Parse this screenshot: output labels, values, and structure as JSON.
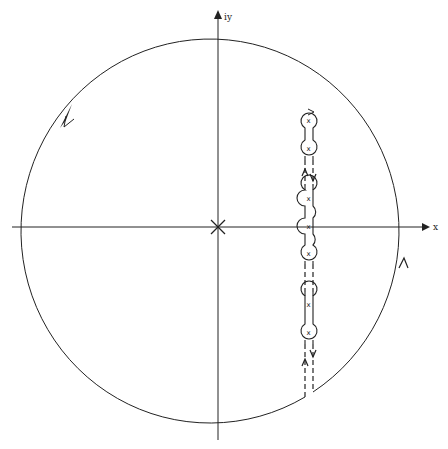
{
  "diagram": {
    "type": "complex-plane contour diagram",
    "axes": {
      "x_label": "x",
      "y_label": "iy",
      "origin_marker": "X"
    },
    "contour": {
      "shape": "large circle",
      "direction": "counter-clockwise",
      "arrows": [
        "upper-left arc",
        "right lower arc"
      ]
    },
    "singularities": {
      "marker": "x",
      "count": 7,
      "column": "vertical line right of origin"
    },
    "cut_path": {
      "style": "dashed paired lines with keyholes around each singularity",
      "arrows": [
        "down (right line)",
        "up (left line)"
      ]
    }
  }
}
